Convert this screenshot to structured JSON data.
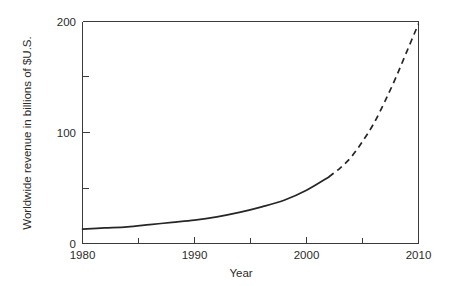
{
  "chart_data": {
    "type": "line",
    "title": "",
    "xlabel": "Year",
    "ylabel": "Worldwide revenue in billions of $U.S.",
    "xlim": [
      1980,
      2010
    ],
    "ylim": [
      0,
      200
    ],
    "grid": false,
    "legend": false,
    "x_major_ticks": [
      1980,
      1990,
      2000,
      2010
    ],
    "x_major_tick_labels": [
      "1980",
      "1990",
      "2000",
      "2010"
    ],
    "x_minor_ticks": [
      1985,
      1995,
      2005
    ],
    "y_major_ticks": [
      0,
      100,
      200
    ],
    "y_major_tick_labels": [
      "0",
      "100",
      "200"
    ],
    "y_minor_ticks": [
      50,
      150
    ],
    "series": [
      {
        "name": "Actual worldwide revenue",
        "style": "solid",
        "x": [
          1980,
          1982,
          1984,
          1986,
          1988,
          1990,
          1992,
          1994,
          1996,
          1998,
          2000,
          2002
        ],
        "values": [
          13,
          14,
          15,
          17,
          19,
          21,
          24,
          28,
          33,
          39,
          48,
          60
        ]
      },
      {
        "name": "Projected worldwide revenue",
        "style": "dashed",
        "x": [
          2002,
          2003,
          2004,
          2005,
          2006,
          2007,
          2008,
          2009,
          2010
        ],
        "values": [
          60,
          68,
          78,
          92,
          108,
          128,
          150,
          174,
          198
        ]
      }
    ]
  },
  "axes": {
    "x_title": "Year",
    "y_title": "Worldwide revenue in billions of $U.S.",
    "x_labels": [
      "1980",
      "1990",
      "2000",
      "2010"
    ],
    "y_labels": [
      "200",
      "100",
      "0"
    ]
  },
  "colors": {
    "line": "#262626",
    "axis": "#3a3a3a",
    "text": "#2b2b2b",
    "background": "#ffffff"
  }
}
